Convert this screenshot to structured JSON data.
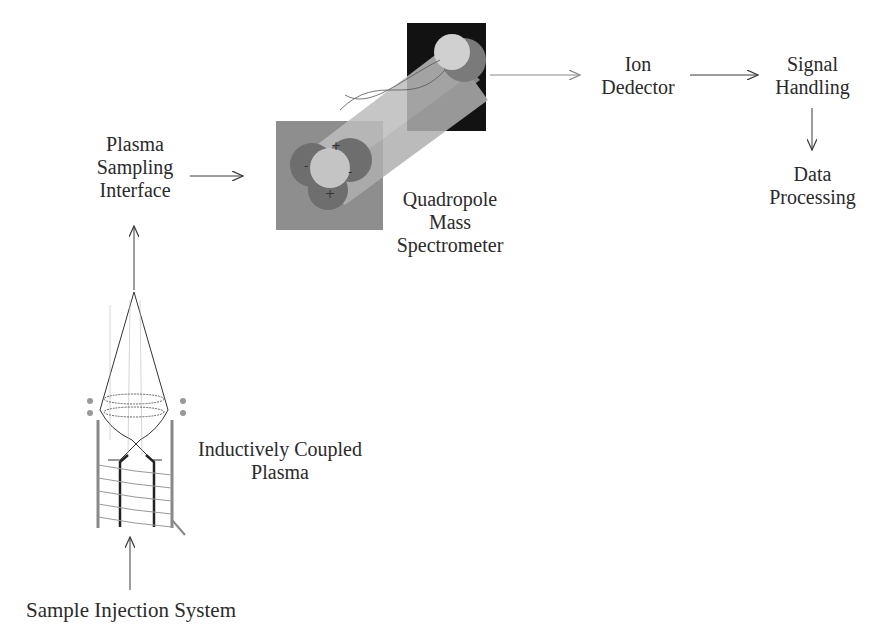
{
  "diagram": {
    "nodes": {
      "plasma_sampling_interface": {
        "lines": [
          "Plasma",
          "Sampling",
          "Interface"
        ]
      },
      "quadropole_mass_spectrometer": {
        "lines": [
          "Quadropole",
          "Mass",
          "Spectrometer"
        ]
      },
      "ion_detector": {
        "lines": [
          "Ion",
          "Dedector"
        ]
      },
      "signal_handling": {
        "lines": [
          "Signal",
          "Handling"
        ]
      },
      "data_processing": {
        "lines": [
          "Data",
          "Processing"
        ]
      },
      "inductively_coupled_plasma": {
        "lines": [
          "Inductively Coupled",
          "Plasma"
        ]
      },
      "sample_injection_system": {
        "lines": [
          "Sample Injection System"
        ]
      }
    },
    "edges": [
      {
        "from": "Sample Injection System",
        "to": "Inductively Coupled Plasma"
      },
      {
        "from": "Inductively Coupled Plasma",
        "to": "Plasma Sampling Interface"
      },
      {
        "from": "Plasma Sampling Interface",
        "to": "Quadropole Mass Spectrometer"
      },
      {
        "from": "Quadropole Mass Spectrometer",
        "to": "Ion Dedector"
      },
      {
        "from": "Ion Dedector",
        "to": "Signal Handling"
      },
      {
        "from": "Signal Handling",
        "to": "Data Processing"
      }
    ],
    "colors": {
      "text": "#2a2a2a",
      "arrow": "#3a3a3a",
      "quad_front_square": "#8c8c8c",
      "quad_back_square": "#111111",
      "rod_light": "#c8c8c8",
      "rod_dark": "#6a6a6a"
    }
  }
}
